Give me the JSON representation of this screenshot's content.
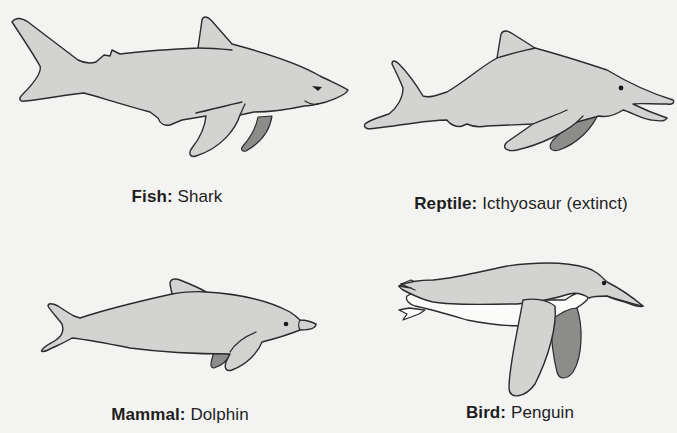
{
  "figure": {
    "colors": {
      "background": "#f3f3f1",
      "body_fill": "#d3d3d1",
      "far_fin_fill": "#8c8c8a",
      "outline": "#2b2b2b",
      "text": "#1e1e1e"
    },
    "panels": [
      {
        "id": "shark",
        "class_label": "Fish:",
        "animal_label": "Shark",
        "icon": "shark-icon"
      },
      {
        "id": "ichthyosaur",
        "class_label": "Reptile:",
        "animal_label": "Icthyosaur (extinct)",
        "icon": "ichthyosaur-icon"
      },
      {
        "id": "dolphin",
        "class_label": "Mammal:",
        "animal_label": "Dolphin",
        "icon": "dolphin-icon"
      },
      {
        "id": "penguin",
        "class_label": "Bird:",
        "animal_label": "Penguin",
        "icon": "penguin-icon"
      }
    ]
  }
}
